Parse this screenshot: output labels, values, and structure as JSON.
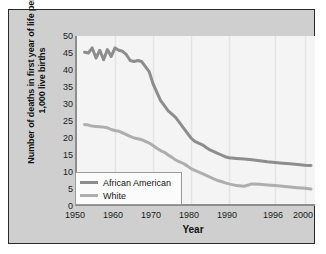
{
  "chart_data": {
    "type": "line",
    "title": "",
    "xlabel": "Year",
    "ylabel": "Number of deaths in first year of life per 1,000 live births",
    "xlim": [
      1950,
      2002
    ],
    "ylim": [
      0,
      50
    ],
    "yticks": [
      0,
      5,
      10,
      15,
      20,
      25,
      30,
      35,
      40,
      45,
      50
    ],
    "xticks": [
      1950,
      1960,
      1970,
      1980,
      1990,
      1996,
      2000
    ],
    "xtick_labels": [
      "1950",
      "1960",
      "1970",
      "1980",
      "1990",
      "1996",
      "2000"
    ],
    "grid": "vertical",
    "legend_position": "lower left",
    "series": [
      {
        "name": "African American",
        "color": "#8d8d8d",
        "x": [
          1952,
          1953,
          1954,
          1955,
          1956,
          1957,
          1958,
          1959,
          1960,
          1961,
          1962,
          1963,
          1964,
          1965,
          1966,
          1967,
          1968,
          1969,
          1970,
          1971,
          1972,
          1973,
          1974,
          1975,
          1976,
          1977,
          1978,
          1979,
          1980,
          1981,
          1982,
          1983,
          1984,
          1985,
          1986,
          1987,
          1988,
          1989,
          1990,
          1991,
          1992,
          1993,
          1994,
          1995,
          1996,
          1997,
          1998,
          1999,
          2000,
          2001
        ],
        "values": [
          45.2,
          45.0,
          46.5,
          43.5,
          45.8,
          43.0,
          46.0,
          44.0,
          46.5,
          45.8,
          45.5,
          44.5,
          42.8,
          42.5,
          42.8,
          42.5,
          41.0,
          39.5,
          36.0,
          33.5,
          31.0,
          29.5,
          28.0,
          27.0,
          26.0,
          24.5,
          23.0,
          21.5,
          20.0,
          19.0,
          18.5,
          18.0,
          17.2,
          16.5,
          16.0,
          15.5,
          15.0,
          14.5,
          14.2,
          14.0,
          13.8,
          13.6,
          13.3,
          13.0,
          12.8,
          12.6,
          12.4,
          12.2,
          12.0,
          11.9
        ]
      },
      {
        "name": "White",
        "color": "#aeaeae",
        "x": [
          1952,
          1953,
          1954,
          1955,
          1956,
          1957,
          1958,
          1959,
          1960,
          1961,
          1962,
          1963,
          1964,
          1965,
          1966,
          1967,
          1968,
          1969,
          1970,
          1971,
          1972,
          1973,
          1974,
          1975,
          1976,
          1977,
          1978,
          1979,
          1980,
          1981,
          1982,
          1983,
          1984,
          1985,
          1986,
          1987,
          1988,
          1989,
          1990,
          1991,
          1992,
          1993,
          1994,
          1995,
          1996,
          1997,
          1998,
          1999,
          2000,
          2001
        ],
        "values": [
          24.0,
          23.8,
          23.5,
          23.4,
          23.3,
          23.2,
          23.0,
          22.5,
          22.2,
          22.0,
          21.5,
          21.0,
          20.5,
          20.0,
          19.8,
          19.5,
          19.0,
          18.5,
          17.8,
          17.0,
          16.3,
          15.8,
          15.0,
          14.3,
          13.5,
          13.0,
          12.5,
          11.8,
          11.0,
          10.5,
          10.0,
          9.5,
          9.0,
          8.5,
          8.0,
          7.5,
          7.2,
          6.8,
          6.5,
          6.0,
          5.8,
          6.5,
          6.4,
          6.2,
          6.0,
          5.8,
          5.6,
          5.4,
          5.2,
          5.0
        ]
      }
    ]
  }
}
